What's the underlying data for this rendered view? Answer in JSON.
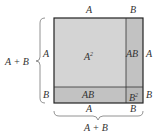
{
  "diagram": {
    "colors": {
      "a_squared": "#d4d4d4",
      "ab": "#c2c2c2",
      "b_squared": "#b8b8b8",
      "outline": "#222222",
      "brace": "#777777",
      "text": "#333333"
    },
    "regions": {
      "a_squared": {
        "label": "A",
        "exp": "2"
      },
      "ab_right": {
        "label": "AB"
      },
      "ab_bottom": {
        "label": "AB"
      },
      "b_squared": {
        "label": "B",
        "exp": "2"
      }
    },
    "top_labels": [
      "A",
      "B"
    ],
    "bottom_labels": [
      "A",
      "B"
    ],
    "right_labels": [
      "A",
      "B"
    ],
    "left_inner_labels": [
      "A",
      "B"
    ],
    "left_brace_label": "A + B",
    "bottom_brace_label": "A + B"
  }
}
